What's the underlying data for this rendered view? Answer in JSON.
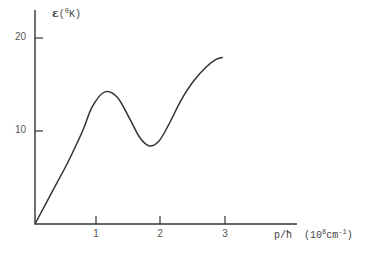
{
  "chart_data": {
    "type": "line",
    "title": "",
    "xlabel": "p/ħ (10^8 cm^-1)",
    "ylabel": "ε (°K)",
    "xlim": [
      0,
      3.8
    ],
    "ylim": [
      0,
      22
    ],
    "x_ticks": [
      1,
      2,
      3
    ],
    "y_ticks": [
      10,
      20
    ],
    "grid": false,
    "legend": null,
    "series": [
      {
        "name": "excitation spectrum",
        "x": [
          0,
          0.25,
          0.5,
          0.75,
          0.9,
          1.1,
          1.3,
          1.5,
          1.65,
          1.8,
          1.95,
          2.1,
          2.3,
          2.5,
          2.7,
          2.85,
          2.95
        ],
        "y": [
          0,
          3.2,
          6.4,
          10.0,
          12.6,
          14.2,
          13.6,
          11.2,
          9.3,
          8.4,
          8.9,
          10.6,
          13.3,
          15.4,
          16.9,
          17.7,
          17.9
        ]
      }
    ]
  },
  "labels": {
    "y_axis": {
      "symbol": "ε",
      "open": "(",
      "sup": "0",
      "unit": "K)"
    },
    "x_axis": {
      "text": "p/ħ",
      "open": "(10",
      "sup": "8",
      "unit": "cm",
      "sup2": "-1",
      "close": ")"
    },
    "y_ticks": [
      "20",
      "10"
    ],
    "x_ticks": [
      "1",
      "2",
      "3"
    ]
  },
  "caption": {
    "text": ""
  }
}
